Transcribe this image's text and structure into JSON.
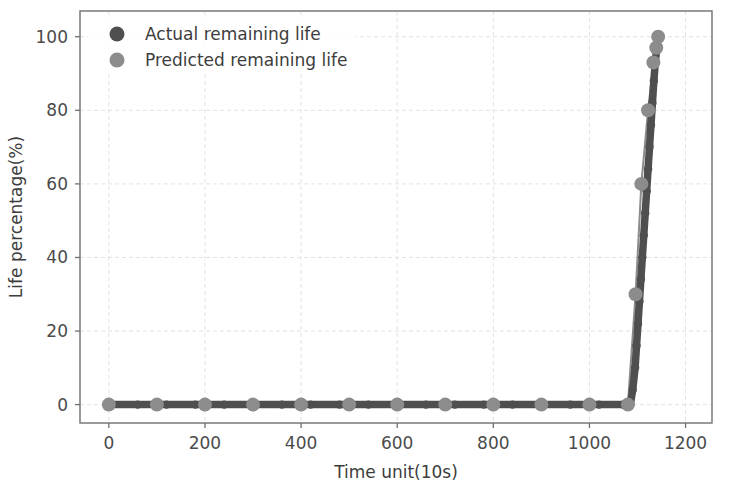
{
  "chart_data": {
    "type": "line",
    "title": "",
    "xlabel": "Time unit(10s)",
    "ylabel": "Life percentage(%)",
    "xlim": [
      -60,
      1255
    ],
    "ylim": [
      -5,
      107
    ],
    "xticks": [
      0,
      200,
      400,
      600,
      800,
      1000,
      1200
    ],
    "xtick_labels": [
      "0",
      "200",
      "400",
      "600",
      "800",
      "1000",
      "1200"
    ],
    "yticks": [
      0,
      20,
      40,
      60,
      80,
      100
    ],
    "ytick_labels": [
      "0",
      "20",
      "40",
      "60",
      "80",
      "100"
    ],
    "grid": true,
    "legend_position": "upper left",
    "series": [
      {
        "name": "Actual remaining life",
        "color": "#4f4f4f",
        "marker": "circle",
        "x": [
          0,
          60,
          120,
          180,
          240,
          300,
          360,
          420,
          480,
          540,
          600,
          660,
          720,
          780,
          840,
          900,
          960,
          1020,
          1070,
          1085,
          1090,
          1095,
          1098,
          1101,
          1104,
          1107,
          1110,
          1113,
          1116,
          1119,
          1122,
          1125,
          1128,
          1131,
          1134,
          1137,
          1140,
          1143
        ],
        "y": [
          0,
          0,
          0,
          0,
          0,
          0,
          0,
          0,
          0,
          0,
          0,
          0,
          0,
          0,
          0,
          0,
          0,
          0,
          0,
          0,
          4,
          10,
          16,
          22,
          28,
          34,
          40,
          46,
          52,
          58,
          64,
          70,
          76,
          82,
          88,
          93,
          97,
          100
        ]
      },
      {
        "name": "Predicted remaining life",
        "color": "#8c8c8c",
        "marker": "circle",
        "x": [
          0,
          100,
          200,
          300,
          400,
          500,
          600,
          700,
          800,
          900,
          1000,
          1080,
          1096,
          1108,
          1122,
          1133,
          1139,
          1143
        ],
        "y": [
          0,
          0,
          0,
          0,
          0,
          0,
          0,
          0,
          0,
          0,
          0,
          0,
          30,
          60,
          80,
          93,
          97,
          100
        ]
      }
    ],
    "legend_entries": [
      {
        "label": "Actual remaining life",
        "color": "#4f4f4f"
      },
      {
        "label": "Predicted remaining life",
        "color": "#8c8c8c"
      }
    ]
  },
  "colors": {
    "background": "#ffffff",
    "actual": "#4f4f4f",
    "predicted": "#8c8c8c",
    "grid": "#e2e2e6",
    "spine": "#6f6f6f",
    "text": "#3d3d3d"
  }
}
